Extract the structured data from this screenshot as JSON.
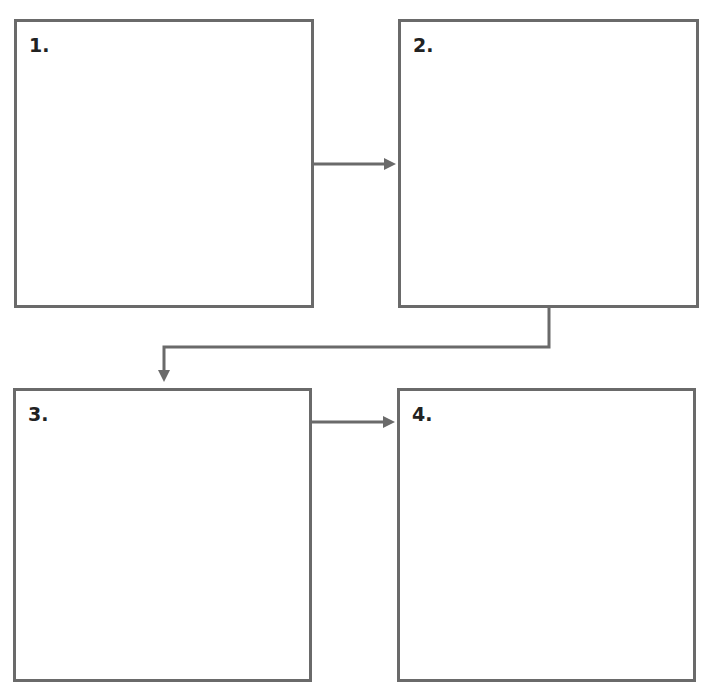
{
  "diagram": {
    "type": "flow-sequence",
    "line_color": "#6a6a6a",
    "boxes": [
      {
        "id": 1,
        "label": "1.",
        "x": 14,
        "y": 19,
        "w": 300,
        "h": 289
      },
      {
        "id": 2,
        "label": "2.",
        "x": 398,
        "y": 19,
        "w": 301,
        "h": 289
      },
      {
        "id": 3,
        "label": "3.",
        "x": 13,
        "y": 388,
        "w": 299,
        "h": 294
      },
      {
        "id": 4,
        "label": "4.",
        "x": 397,
        "y": 388,
        "w": 299,
        "h": 294
      }
    ],
    "arrows": [
      {
        "from": 1,
        "to": 2
      },
      {
        "from": 2,
        "to": 3
      },
      {
        "from": 3,
        "to": 4
      }
    ]
  }
}
